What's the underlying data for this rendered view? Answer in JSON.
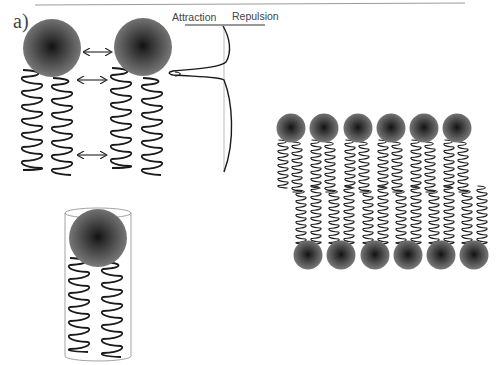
{
  "figure": {
    "panel_label": "a)",
    "potential_plot": {
      "left_label": "Attraction",
      "right_label": "Repulsion"
    },
    "elements": {
      "lipid_pair_heads": 2,
      "interaction_arrows": 3,
      "cylinder_lipid": 1,
      "bilayer_top_heads": 6,
      "bilayer_bottom_heads": 6
    },
    "colors": {
      "head_center": "#151515",
      "head_edge": "#6e6e6e",
      "tail_stroke": "#1a1a1a",
      "rule": "#9a9a9a",
      "cylinder": "#8a8a8a"
    }
  }
}
